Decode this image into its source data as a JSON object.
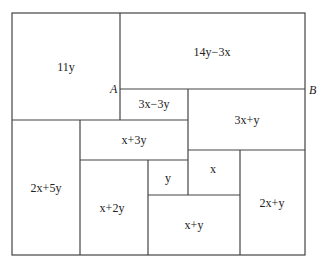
{
  "diagram": {
    "type": "rectangle-dissection",
    "points": [
      {
        "name": "A",
        "label": "A"
      },
      {
        "name": "B",
        "label": "B"
      }
    ],
    "regions": [
      {
        "id": "r1",
        "label": "11y"
      },
      {
        "id": "r2",
        "label": "14y−3x"
      },
      {
        "id": "r3",
        "label": "3x−3y"
      },
      {
        "id": "r4",
        "label": "3x+y"
      },
      {
        "id": "r5",
        "label": "x+3y"
      },
      {
        "id": "r6",
        "label": "2x+5y"
      },
      {
        "id": "r7",
        "label": "x+2y"
      },
      {
        "id": "r8",
        "label": "y"
      },
      {
        "id": "r9",
        "label": "x"
      },
      {
        "id": "r10",
        "label": "x+y"
      },
      {
        "id": "r11",
        "label": "2x+y"
      }
    ],
    "colors": {
      "line": "#444444",
      "text": "#222222",
      "background": "#ffffff"
    }
  }
}
